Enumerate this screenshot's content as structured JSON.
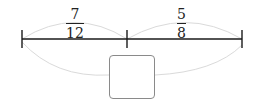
{
  "diagram": {
    "segments": [
      {
        "numerator": "7",
        "denominator": "12"
      },
      {
        "numerator": "5",
        "denominator": "8"
      }
    ],
    "answer_box": ""
  },
  "colors": {
    "line": "#1a1a1a",
    "arc": "#d8d8d8",
    "box_border": "#8a8a8a"
  }
}
